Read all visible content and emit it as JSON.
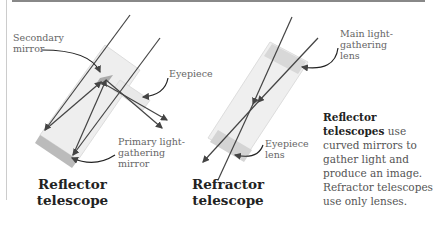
{
  "reflector": {
    "secondary_mirror": "Secondary mirror",
    "eyepiece": "Eyepiece",
    "primary_mirror": "Primary light-gathering mirror",
    "title_line1": "Reflector",
    "title_line2": "telescope"
  },
  "refractor": {
    "main_lens": "Main light-gathering lens",
    "eyepiece_lens": "Eyepiece lens",
    "title_line1": "Refractor",
    "title_line2": "telescope"
  },
  "description": {
    "bold": "Reflector telescopes",
    "text": " use curved mirrors to gather light and produce an image. Refractor telescopes use only lenses."
  },
  "colors": {
    "ray": "#444444",
    "tube": "#e8e8e8",
    "label": "#666666"
  }
}
